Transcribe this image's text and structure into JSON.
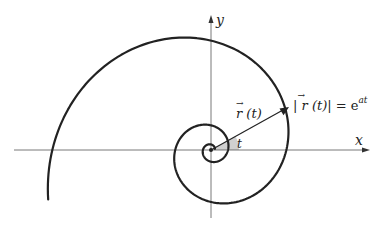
{
  "diagram": {
    "type": "logarithmic-spiral",
    "axes": {
      "x_label": "x",
      "y_label": "y",
      "origin_px": [
        211,
        150
      ]
    },
    "spiral": {
      "equation": "r = e^(a t)",
      "r0_px": 17,
      "k": 0.237,
      "theta_end": 9.72,
      "stroke": "#222222",
      "stroke_width": 2.2
    },
    "vector": {
      "label_main": "r",
      "label_arg": "(t)",
      "tip_px": [
        289,
        107
      ]
    },
    "magnitude_label": {
      "left": "|",
      "r": "r",
      "arg": "(t)",
      "right": "| = e",
      "exponent": "at"
    },
    "angle": {
      "label": "t",
      "fill": "#cfcfcf"
    },
    "colors": {
      "axis": "#555555",
      "curve": "#222222",
      "angle_fill": "#d0d0d0"
    }
  }
}
